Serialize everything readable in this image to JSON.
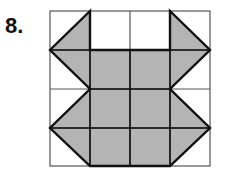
{
  "problem": {
    "number_label": "8.",
    "grid": {
      "rows": 4,
      "cols": 4
    },
    "colors": {
      "fill": "#b4b4b4",
      "grid_line": "#555555",
      "outline": "#111111",
      "background": "#ffffff"
    },
    "shaded_polygon_grid_coords": [
      [
        1,
        0
      ],
      [
        0,
        1
      ],
      [
        1,
        2
      ],
      [
        0,
        3
      ],
      [
        1,
        4
      ],
      [
        3,
        4
      ],
      [
        4,
        3
      ],
      [
        3,
        2
      ],
      [
        4,
        1
      ],
      [
        3,
        0
      ],
      [
        3,
        1
      ],
      [
        1,
        1
      ]
    ]
  }
}
